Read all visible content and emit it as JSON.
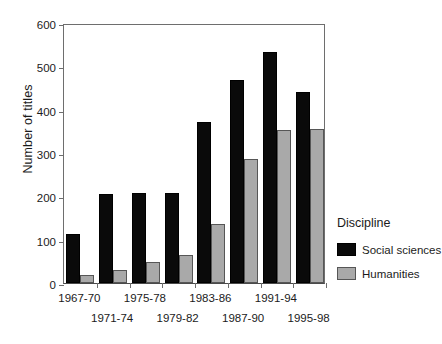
{
  "chart_data": {
    "type": "bar",
    "title": "",
    "xlabel": "",
    "ylabel": "Number of titles",
    "ylim": [
      0,
      600
    ],
    "yticks": [
      0,
      100,
      200,
      300,
      400,
      500,
      600
    ],
    "grid": false,
    "legend_position": "right",
    "legend_title": "Discipline",
    "categories": [
      "1967-70",
      "1971-74",
      "1975-78",
      "1979-82",
      "1983-86",
      "1987-90",
      "1991-94",
      "1995-98"
    ],
    "series": [
      {
        "name": "Social sciences",
        "color": "#0a0a0a",
        "values": [
          113,
          206,
          207,
          208,
          371,
          469,
          534,
          440
        ]
      },
      {
        "name": "Humanities",
        "color": "#a9a9a9",
        "values": [
          18,
          31,
          49,
          65,
          137,
          286,
          354,
          355
        ]
      }
    ]
  }
}
